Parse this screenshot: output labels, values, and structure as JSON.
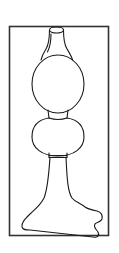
{
  "figure": {
    "description": "Line drawing of a lamp-like vessel with a narrow neck, two stacked spheres, a tapered stem and an irregular flared base, enclosed in a rectangular frame",
    "stroke_color": "#1a1a1a",
    "frame_color": "#333333",
    "background": "#ffffff"
  }
}
